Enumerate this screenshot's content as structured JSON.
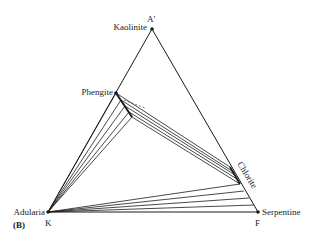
{
  "figure": {
    "panel_label": "(B)",
    "vertices": {
      "top": {
        "label": "A′",
        "mineral": "Kaolinite"
      },
      "left": {
        "label": "K",
        "mineral": "Adularia"
      },
      "right": {
        "label": "F",
        "mineral": "Serpentine"
      }
    },
    "phases": {
      "phengite": "Phengite",
      "chlorite": "Chlorite"
    },
    "colors": {
      "line": "#1a1a1a",
      "background": "#ffffff"
    }
  }
}
